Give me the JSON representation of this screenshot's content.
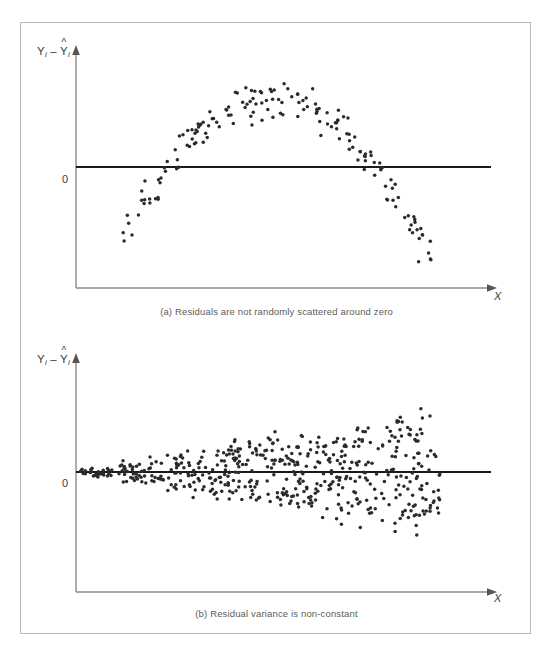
{
  "figure": {
    "border_color": "#b9b9b9",
    "background": "#ffffff",
    "dot_color": "#2b2b2b",
    "axis_color": "#8a8a8a",
    "zero_line_color": "#1a1a1a"
  },
  "panels": [
    {
      "id": "a",
      "caption": "(a) Residuals are not randomly scattered around zero",
      "y_axis_label_parts": {
        "y": "Y",
        "i1": "i",
        "minus": "–",
        "yhat": "Y",
        "i2": "i"
      },
      "y_axis_label_text": "Yi – Ŷi",
      "x_axis_label": "X",
      "zero_label": "0"
    },
    {
      "id": "b",
      "caption": "(b) Residual variance is non-constant",
      "y_axis_label_parts": {
        "y": "Y",
        "i1": "i",
        "minus": "–",
        "yhat": "Y",
        "i2": "i"
      },
      "y_axis_label_text": "Yi – Ŷi",
      "x_axis_label": "X",
      "zero_label": "0"
    }
  ],
  "chart_data": [
    {
      "type": "scatter",
      "panel": "a",
      "title": "(a) Residuals are not randomly scattered around zero",
      "xlabel": "X",
      "ylabel": "Yi – Ŷi",
      "grid": false,
      "legend": "none",
      "reference_line": {
        "y": 0,
        "label": "0",
        "style": "solid",
        "color": "#1a1a1a"
      },
      "xlim": [
        0,
        100
      ],
      "ylim": [
        -100,
        100
      ],
      "pattern": "inverted-u / quadratic curvature with random jitter",
      "model": "y = 74 - 0.118*(x-47)^2 + noise(sd~13)",
      "n_points": 180,
      "x_range_points": [
        11,
        90
      ],
      "seed": 17
    },
    {
      "type": "scatter",
      "panel": "b",
      "title": "(b) Residual variance is non-constant",
      "xlabel": "X",
      "ylabel": "Yi – Ŷi",
      "grid": false,
      "legend": "none",
      "reference_line": {
        "y": 0,
        "label": "0",
        "style": "solid",
        "color": "#1a1a1a"
      },
      "xlim": [
        0,
        100
      ],
      "ylim": [
        -100,
        100
      ],
      "pattern": "megaphone / fan shape, spread increases with x (heteroscedastic)",
      "model": "y = uniform(-1,1) * (3 + 0.92*x) + noise",
      "n_points": 520,
      "x_range_points": [
        1,
        88
      ],
      "seed": 91
    }
  ]
}
